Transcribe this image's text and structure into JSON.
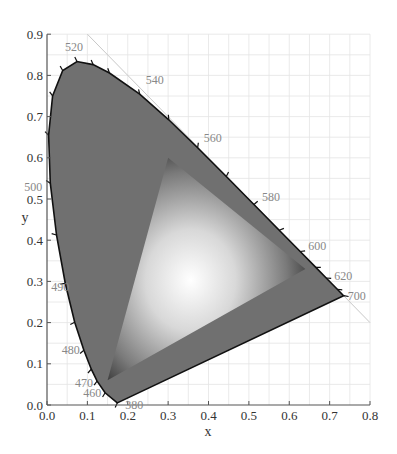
{
  "chart_data": {
    "type": "scatter",
    "xlabel": "x",
    "ylabel": "y",
    "xlim": [
      0.0,
      0.8
    ],
    "ylim": [
      0.0,
      0.9
    ],
    "grid": true,
    "x_ticks": [
      "0.0",
      "0.1",
      "0.2",
      "0.3",
      "0.4",
      "0.5",
      "0.6",
      "0.7",
      "0.8"
    ],
    "y_ticks": [
      "0.0",
      "0.1",
      "0.2",
      "0.3",
      "0.4",
      "0.5",
      "0.6",
      "0.7",
      "0.8",
      "0.9"
    ],
    "series": [
      {
        "name": "spectral locus",
        "points": [
          {
            "nm": 380,
            "x": 0.1741,
            "y": 0.005
          },
          {
            "nm": 460,
            "x": 0.144,
            "y": 0.0297
          },
          {
            "nm": 470,
            "x": 0.1241,
            "y": 0.0578
          },
          {
            "nm": 475,
            "x": 0.1096,
            "y": 0.0868
          },
          {
            "nm": 480,
            "x": 0.0913,
            "y": 0.1327
          },
          {
            "nm": 485,
            "x": 0.0687,
            "y": 0.2007
          },
          {
            "nm": 490,
            "x": 0.0454,
            "y": 0.295
          },
          {
            "nm": 495,
            "x": 0.0235,
            "y": 0.4127
          },
          {
            "nm": 500,
            "x": 0.0082,
            "y": 0.5384
          },
          {
            "nm": 505,
            "x": 0.0039,
            "y": 0.6548
          },
          {
            "nm": 510,
            "x": 0.0139,
            "y": 0.7502
          },
          {
            "nm": 515,
            "x": 0.0389,
            "y": 0.812
          },
          {
            "nm": 520,
            "x": 0.0743,
            "y": 0.8338
          },
          {
            "nm": 525,
            "x": 0.1142,
            "y": 0.8262
          },
          {
            "nm": 530,
            "x": 0.1547,
            "y": 0.8059
          },
          {
            "nm": 540,
            "x": 0.2296,
            "y": 0.7543
          },
          {
            "nm": 550,
            "x": 0.3016,
            "y": 0.6923
          },
          {
            "nm": 560,
            "x": 0.3731,
            "y": 0.6245
          },
          {
            "nm": 570,
            "x": 0.4441,
            "y": 0.5547
          },
          {
            "nm": 580,
            "x": 0.5125,
            "y": 0.4866
          },
          {
            "nm": 590,
            "x": 0.5752,
            "y": 0.4242
          },
          {
            "nm": 600,
            "x": 0.627,
            "y": 0.3725
          },
          {
            "nm": 610,
            "x": 0.6658,
            "y": 0.334
          },
          {
            "nm": 620,
            "x": 0.6915,
            "y": 0.3083
          },
          {
            "nm": 640,
            "x": 0.719,
            "y": 0.2809
          },
          {
            "nm": 700,
            "x": 0.7347,
            "y": 0.2653
          }
        ]
      },
      {
        "name": "gamut triangle",
        "points": [
          {
            "label": "R",
            "x": 0.64,
            "y": 0.33
          },
          {
            "label": "G",
            "x": 0.3,
            "y": 0.6
          },
          {
            "label": "B",
            "x": 0.15,
            "y": 0.06
          }
        ]
      },
      {
        "name": "x+y=1 line",
        "points": [
          {
            "x": 0.1,
            "y": 0.9
          },
          {
            "x": 0.8,
            "y": 0.2
          }
        ]
      }
    ],
    "wavelength_labels": [
      {
        "text": "520",
        "nm": 520
      },
      {
        "text": "540",
        "nm": 540
      },
      {
        "text": "560",
        "nm": 560
      },
      {
        "text": "580",
        "nm": 580
      },
      {
        "text": "600",
        "nm": 600
      },
      {
        "text": "620",
        "nm": 620
      },
      {
        "text": "700",
        "nm": 700
      },
      {
        "text": "500",
        "nm": 500
      },
      {
        "text": "490",
        "nm": 490
      },
      {
        "text": "480",
        "nm": 480
      },
      {
        "text": "470",
        "nm": 470
      },
      {
        "text": "460",
        "nm": 460
      },
      {
        "text": "380",
        "nm": 380
      }
    ],
    "colors": {
      "locus_fill": "#707070",
      "locus_stroke": "#111111",
      "gamut_center": "#ffffff",
      "gamut_edge": "#3a3a3a",
      "grid": "#e4e4e4",
      "axis": "#555555"
    }
  }
}
